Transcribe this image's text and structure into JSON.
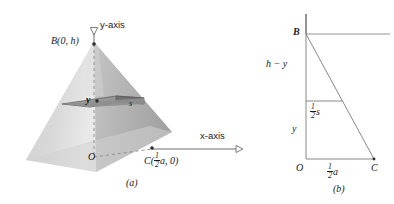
{
  "figure": {
    "caption_a": "(a)",
    "caption_b": "(b)",
    "panel_a": {
      "y_axis_label": "y-axis",
      "x_axis_label": "x-axis",
      "apex_label": "B(0, h)",
      "origin_label": "O",
      "base_point_label_prefix": "C(",
      "base_point_frac_num": "1",
      "base_point_frac_den": "2",
      "base_point_label_suffix": "a, 0)",
      "slab_height_label": "y",
      "slab_side_label": "s"
    },
    "panel_b": {
      "apex_label": "B",
      "upper_segment_label": "h − y",
      "half_side_frac_num": "1",
      "half_side_frac_den": "2",
      "half_side_label_suffix": "s",
      "lower_segment_label": "y",
      "origin_label": "O",
      "base_frac_num": "1",
      "base_frac_den": "2",
      "base_label_suffix": "a",
      "corner_label": "C"
    }
  },
  "colors": {
    "line": "#6e6e6e",
    "dark_line": "#2b2b2b",
    "slab_fill": "#9a9a9a",
    "slab_fill_dark": "#6f6f6f",
    "pyramid_light": "#d8d8d8",
    "pyramid_mid": "#c2c2c2",
    "pyramid_dark": "#a8a8a8"
  }
}
